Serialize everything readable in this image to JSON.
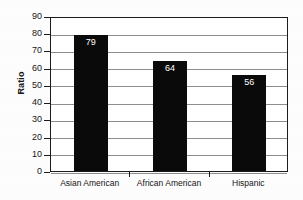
{
  "chart_data": {
    "type": "bar",
    "title": "",
    "xlabel": "",
    "ylabel": "Ratio",
    "categories": [
      "Asian American",
      "African American",
      "Hispanic"
    ],
    "values": [
      79,
      64,
      56
    ],
    "value_labels": [
      "79",
      "64",
      "56"
    ],
    "ylim": [
      0,
      90
    ],
    "ytick_labels": [
      "0",
      "10",
      "20",
      "30",
      "40",
      "50",
      "60",
      "70",
      "80",
      "90"
    ],
    "ytick_values": [
      0,
      10,
      20,
      30,
      40,
      50,
      60,
      70,
      80,
      90
    ],
    "grid": true,
    "legend": false,
    "bar_color": "#0a0a0a",
    "value_label_color": "#ffffff",
    "gridline_color": "#8d8d8d",
    "axis_color": "#1c1c1c",
    "plot_background": "#ffffff"
  }
}
